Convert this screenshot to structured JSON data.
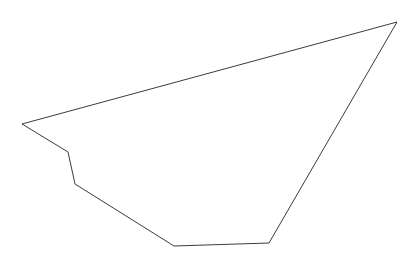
{
  "canvas": {
    "width": 418,
    "height": 268,
    "background_color": "#ffffff"
  },
  "figure": {
    "name": "polygon-outline",
    "stroke_color": "#3c3c3c",
    "stroke_width": 1,
    "fill_color": "none",
    "closed": true,
    "vertex_count": 6,
    "vertices": [
      {
        "label": "top-right-apex",
        "x": 397,
        "y": 22
      },
      {
        "label": "left-point",
        "x": 22,
        "y": 124
      },
      {
        "label": "notch-upper-bend",
        "x": 68,
        "y": 152
      },
      {
        "label": "notch-lower-bend",
        "x": 75,
        "y": 184
      },
      {
        "label": "bottom-left-bend",
        "x": 174,
        "y": 246
      },
      {
        "label": "bottom-right-bend",
        "x": 269,
        "y": 243
      }
    ],
    "path_d": "M 397 22 L 22 124 L 68 152 L 75 184 L 174 246 L 269 243 Z"
  }
}
